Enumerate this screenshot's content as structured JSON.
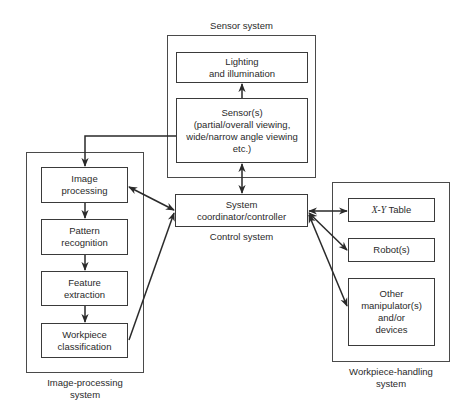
{
  "groups": {
    "sensor": {
      "label": "Sensor system",
      "boxes": {
        "lighting": "Lighting\nand illumination",
        "sensors": "Sensor(s)\n(partial/overall viewing,\nwide/narrow angle viewing\netc.)"
      }
    },
    "image_processing": {
      "label": "Image-processing\nsystem",
      "boxes": {
        "image_processing": "Image\nprocessing",
        "pattern_recognition": "Pattern\nrecognition",
        "feature_extraction": "Feature\nextraction",
        "workpiece_classification": "Workpiece\nclassification"
      }
    },
    "control": {
      "label": "Control system",
      "boxes": {
        "coordinator": "System\ncoordinator/controller"
      }
    },
    "workpiece_handling": {
      "label": "Workpiece-handling\nsystem",
      "boxes": {
        "xy_table_var": "X-Y",
        "xy_table_rest": " Table",
        "robots": "Robot(s)",
        "other": "Other\nmanipulator(s)\nand/or\ndevices"
      }
    }
  },
  "colors": {
    "line": "#2a2a2a",
    "border": "#3a3a3a",
    "background": "#ffffff"
  }
}
